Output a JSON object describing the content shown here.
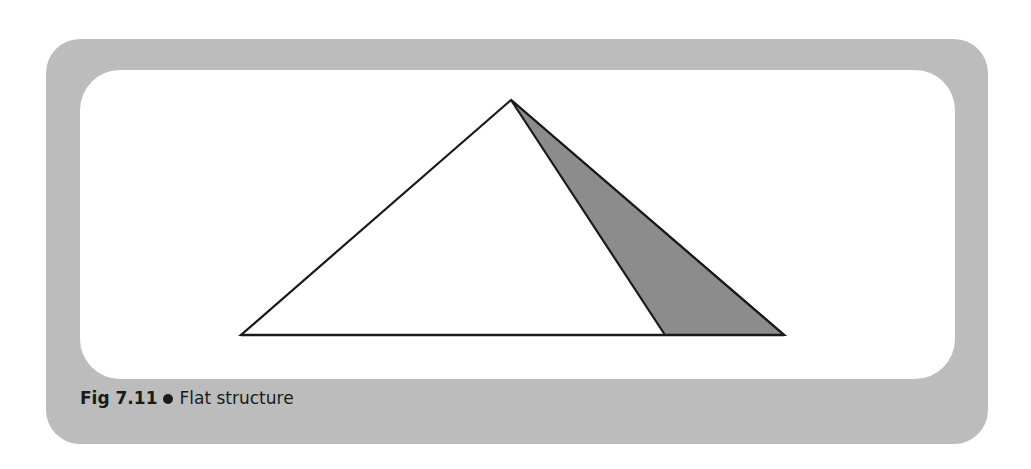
{
  "figure": {
    "number_label": "Fig 7.11",
    "title": "Flat structure",
    "separator": "bullet"
  },
  "diagram": {
    "type": "flat-structure-pyramid",
    "colors": {
      "frame": "#bcbcbc",
      "panel": "#ffffff",
      "outline": "#1a1a1a",
      "shaded_face": "#8c8c8c"
    },
    "triangle": {
      "apex": [
        511,
        100
      ],
      "base_left": [
        241,
        335
      ],
      "base_right": [
        784,
        335
      ]
    },
    "shaded_face": {
      "apex": [
        511,
        100
      ],
      "base_left": [
        665,
        335
      ],
      "base_right": [
        784,
        335
      ]
    }
  }
}
